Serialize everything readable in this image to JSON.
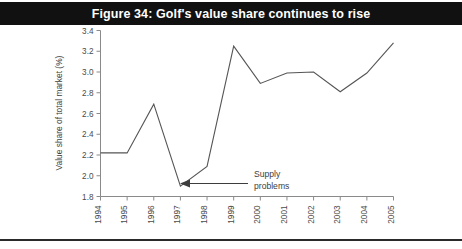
{
  "figure": {
    "title": "Figure 34: Golf's value share continues to rise"
  },
  "chart_data": {
    "type": "line",
    "title": "Figure 34: Golf's value share continues to rise",
    "xlabel": "",
    "ylabel": "Value share of total market (%)",
    "categories": [
      "1994",
      "1995",
      "1996",
      "1997",
      "1998",
      "1999",
      "2000",
      "2001",
      "2002",
      "2003",
      "2004",
      "2005"
    ],
    "values": [
      2.22,
      2.22,
      2.69,
      1.9,
      2.09,
      3.25,
      2.89,
      2.99,
      3.0,
      2.81,
      2.99,
      3.28
    ],
    "ylim": [
      1.8,
      3.4
    ],
    "ytick_labels": [
      "1.8",
      "2.0",
      "2.2",
      "2.4",
      "2.6",
      "2.8",
      "3.0",
      "3.2",
      "3.4"
    ],
    "ytick_values": [
      1.8,
      2.0,
      2.2,
      2.4,
      2.6,
      2.8,
      3.0,
      3.2,
      3.4
    ],
    "grid": false,
    "legend": false,
    "series_color": "#555555",
    "annotations": [
      {
        "text_line1": "Supply",
        "text_line2": "problems",
        "points_to_category": "1997"
      }
    ]
  }
}
